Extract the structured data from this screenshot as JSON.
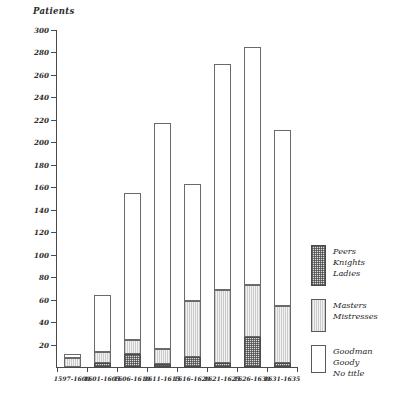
{
  "chart_data": {
    "type": "bar",
    "subtype": "stacked-bar",
    "title": "",
    "xlabel": "",
    "ylabel": "Patients",
    "ylim": [
      0,
      300
    ],
    "ytick_step": 20,
    "yticks": [
      300,
      280,
      260,
      240,
      220,
      200,
      180,
      160,
      140,
      120,
      100,
      80,
      60,
      40,
      20
    ],
    "grid": false,
    "legend_position": "right",
    "categories": [
      "1597-1600",
      "1601-1605",
      "1606-1610",
      "1611-1615",
      "1616-1620",
      "1621-1625",
      "1626-1630",
      "1631-1635"
    ],
    "series": [
      {
        "name": "Peers Knights Ladies",
        "fill": "cross-hatch-dark",
        "values": [
          0,
          4,
          12,
          3,
          9,
          4,
          27,
          4
        ]
      },
      {
        "name": "Masters Mistresses",
        "fill": "light-vertical-hatch",
        "values": [
          8,
          9,
          12,
          13,
          50,
          65,
          46,
          50
        ]
      },
      {
        "name": "Goodman Goody No title",
        "fill": "white",
        "values": [
          4,
          51,
          131,
          201,
          104,
          201,
          212,
          157
        ]
      }
    ],
    "totals": [
      12,
      64,
      155,
      217,
      163,
      270,
      285,
      211
    ],
    "legend": [
      {
        "swatch": "cross-hatch-dark",
        "lines": [
          "Peers",
          "Knights",
          "Ladies"
        ]
      },
      {
        "swatch": "light-vertical-hatch",
        "lines": [
          "Masters",
          "Mistresses"
        ]
      },
      {
        "swatch": "white",
        "lines": [
          "Goodman",
          "Goody",
          "No title"
        ]
      }
    ]
  }
}
